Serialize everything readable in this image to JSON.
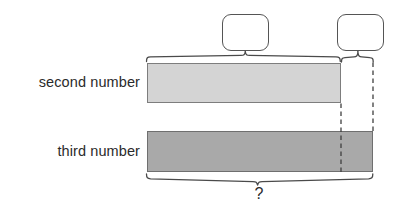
{
  "diagram": {
    "type": "bar-model",
    "background_color": "#ffffff",
    "rows": [
      {
        "label": "second number",
        "bar_name": "second-number-bar",
        "fill_color": "#d4d4d4",
        "stroke_color": "#7d7d7d",
        "relative_length": 194
      },
      {
        "label": "third number",
        "bar_name": "third-number-bar",
        "fill_color": "#a9a9a9",
        "stroke_color": "#6f6f6f",
        "relative_length": 226
      }
    ],
    "callouts": [
      {
        "name": "left-callout-box",
        "text": "",
        "stroke_color": "#555555"
      },
      {
        "name": "right-callout-box",
        "text": "",
        "stroke_color": "#555555"
      }
    ],
    "braces": [
      {
        "name": "top-left-brace",
        "label": "",
        "spans": "second number bar"
      },
      {
        "name": "top-right-brace",
        "label": "",
        "spans": "difference between third and second number"
      },
      {
        "name": "bottom-brace",
        "label": "?",
        "spans": "third number bar"
      }
    ],
    "dashed_guides": [
      {
        "name": "dashed-guide-second-bar-end"
      },
      {
        "name": "dashed-guide-third-bar-end"
      }
    ],
    "unknown_label": "?",
    "line_color": "#4a4a4a",
    "text_color": "#2b2b2b"
  }
}
